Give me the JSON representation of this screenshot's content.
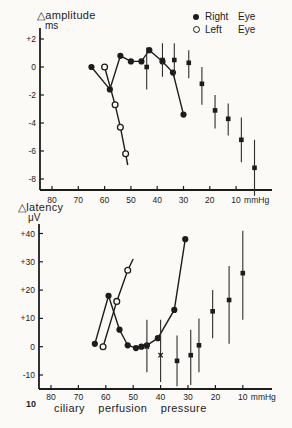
{
  "page": {
    "background": "#fbfaf7",
    "ink": "#1c1c1c",
    "page_number": "10"
  },
  "caption": "ciliary perfusion pressure",
  "legend": {
    "items": [
      {
        "marker": "filled-circle",
        "word1": "Right",
        "word2": "Eye"
      },
      {
        "marker": "open-circle",
        "word1": "Left",
        "word2": "Eye"
      }
    ]
  },
  "chart_data": [
    {
      "type": "line",
      "title": "△amplitude",
      "unit": "ms",
      "x_unit": "mmHg",
      "xlabel": "ciliary perfusion pressure (mmHg), axis reversed",
      "ylabel": "Δ amplitude (ms)",
      "x_axis_reversed": true,
      "xlim": [
        85,
        0
      ],
      "ylim": [
        -9.5,
        2.5
      ],
      "grid": false,
      "legend_position": "top-right",
      "x_ticks": [
        80,
        70,
        60,
        50,
        40,
        30,
        20,
        10
      ],
      "y_ticks": [
        {
          "v": 2,
          "label": "+2"
        },
        {
          "v": 0,
          "label": "0"
        },
        {
          "v": -2,
          "label": "-2"
        },
        {
          "v": -4,
          "label": "-4"
        },
        {
          "v": -6,
          "label": "-6"
        },
        {
          "v": -8,
          "label": "-8"
        }
      ],
      "series": [
        {
          "name": "Right Eye",
          "marker": "filled-circle",
          "line": true,
          "points": [
            [
              65,
              0
            ],
            [
              58,
              -1.6
            ],
            [
              54,
              0.8
            ],
            [
              50,
              0.4
            ],
            [
              46,
              0.4
            ],
            [
              43,
              1.2
            ],
            [
              38,
              0.4
            ],
            [
              34,
              -0.4
            ],
            [
              30,
              -3.4
            ]
          ]
        },
        {
          "name": "Left Eye",
          "marker": "open-circle",
          "line": true,
          "points": [
            [
              60,
              0
            ],
            [
              56,
              -2.7
            ],
            [
              54,
              -4.3
            ],
            [
              52,
              -6.2
            ]
          ],
          "tail": [
            51.2,
            -7
          ]
        },
        {
          "name": "mean with error bars",
          "marker": "filled-square",
          "line": false,
          "error_bars": true,
          "points": [
            {
              "x": 44,
              "y": 0,
              "lo": -1.6,
              "hi": 1.4
            },
            {
              "x": 38,
              "y": 0.5,
              "lo": -0.7,
              "hi": 1.7
            },
            {
              "x": 33.5,
              "y": 0.5,
              "lo": -0.7,
              "hi": 1.7
            },
            {
              "x": 28,
              "y": 0.3,
              "lo": -0.8,
              "hi": 1.2
            },
            {
              "x": 23,
              "y": -1.2,
              "lo": -2.7,
              "hi": 0.0
            },
            {
              "x": 18,
              "y": -3.1,
              "lo": -4.4,
              "hi": -2.0
            },
            {
              "x": 13,
              "y": -3.7,
              "lo": -4.9,
              "hi": -2.6
            },
            {
              "x": 8,
              "y": -5.2,
              "lo": -6.8,
              "hi": -3.6
            },
            {
              "x": 3,
              "y": -7.2,
              "lo": -9.2,
              "hi": -5.2
            }
          ]
        }
      ]
    },
    {
      "type": "line",
      "title": "△latency",
      "unit": "μV",
      "x_unit": "mmHg",
      "xlabel": "ciliary perfusion pressure (mmHg), axis reversed",
      "ylabel": "Δ latency (μV)",
      "x_axis_reversed": true,
      "xlim": [
        85,
        0
      ],
      "ylim": [
        -15,
        42
      ],
      "grid": false,
      "x_ticks": [
        80,
        70,
        60,
        50,
        40,
        30,
        20,
        10
      ],
      "y_ticks": [
        {
          "v": 40,
          "label": "+40"
        },
        {
          "v": 30,
          "label": "+30"
        },
        {
          "v": 20,
          "label": "+20"
        },
        {
          "v": 10,
          "label": "+10"
        },
        {
          "v": 0,
          "label": "0"
        },
        {
          "v": -10,
          "label": "-10"
        }
      ],
      "series": [
        {
          "name": "Right Eye",
          "marker": "filled-circle",
          "line": true,
          "points": [
            [
              64,
              1
            ],
            [
              59,
              18
            ],
            [
              55,
              6
            ],
            [
              52,
              0.5
            ],
            [
              49,
              -0.5
            ],
            [
              47,
              0
            ],
            [
              45,
              0.5
            ],
            [
              41,
              3
            ],
            [
              35,
              13
            ],
            [
              31,
              38
            ]
          ]
        },
        {
          "name": "Left Eye",
          "marker": "open-circle",
          "line": true,
          "points": [
            [
              61,
              0
            ],
            [
              56,
              16
            ],
            [
              52,
              27
            ]
          ],
          "tail": [
            50,
            31
          ]
        },
        {
          "name": "mean with error bars",
          "marker": "filled-square",
          "line": false,
          "error_bars": true,
          "points": [
            {
              "x": 45,
              "y": 0,
              "lo": -9,
              "hi": 9.5,
              "marker": "x"
            },
            {
              "x": 40,
              "y": -3,
              "lo": -12.5,
              "hi": 9.5,
              "marker": "x"
            },
            {
              "x": 34,
              "y": -5,
              "lo": -14,
              "hi": 4
            },
            {
              "x": 29,
              "y": -3,
              "lo": -13.5,
              "hi": 6
            },
            {
              "x": 26,
              "y": 0.5,
              "lo": -9,
              "hi": 10
            },
            {
              "x": 21,
              "y": 12.5,
              "lo": 3,
              "hi": 20
            },
            {
              "x": 15,
              "y": 16.5,
              "lo": 1,
              "hi": 28.5
            },
            {
              "x": 10,
              "y": 26,
              "lo": 9.5,
              "hi": 41
            }
          ]
        }
      ]
    }
  ]
}
